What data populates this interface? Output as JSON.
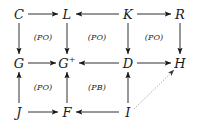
{
  "figure": {
    "kind": "commutative-diagram",
    "background_color": "#ffffff",
    "ink_color": "#1a1a1a",
    "width": 210,
    "height": 126
  },
  "nodes": [
    {
      "id": "C",
      "label": "C",
      "sup": "",
      "x": 19,
      "y": 14,
      "row": 0,
      "col": 0
    },
    {
      "id": "L",
      "label": "L",
      "sup": "",
      "x": 67,
      "y": 14,
      "row": 0,
      "col": 1
    },
    {
      "id": "K",
      "label": "K",
      "sup": "",
      "x": 128,
      "y": 14,
      "row": 0,
      "col": 2
    },
    {
      "id": "R",
      "label": "R",
      "sup": "",
      "x": 180,
      "y": 14,
      "row": 0,
      "col": 3
    },
    {
      "id": "G",
      "label": "G",
      "sup": "",
      "x": 19,
      "y": 63,
      "row": 1,
      "col": 0
    },
    {
      "id": "Gp",
      "label": "G",
      "sup": "+",
      "x": 67,
      "y": 63,
      "row": 1,
      "col": 1
    },
    {
      "id": "D",
      "label": "D",
      "sup": "",
      "x": 128,
      "y": 63,
      "row": 1,
      "col": 2
    },
    {
      "id": "H",
      "label": "H",
      "sup": "",
      "x": 180,
      "y": 63,
      "row": 1,
      "col": 3
    },
    {
      "id": "J",
      "label": "J",
      "sup": "",
      "x": 19,
      "y": 112,
      "row": 2,
      "col": 0
    },
    {
      "id": "F",
      "label": "F",
      "sup": "",
      "x": 67,
      "y": 112,
      "row": 2,
      "col": 1
    },
    {
      "id": "I",
      "label": "I",
      "sup": "",
      "x": 128,
      "y": 112,
      "row": 2,
      "col": 2
    }
  ],
  "arrows": [
    {
      "id": "C-to-L",
      "from": "C",
      "to": "L",
      "style": "solid",
      "x1": 28,
      "y1": 14,
      "x2": 58,
      "y2": 14
    },
    {
      "id": "K-to-L",
      "from": "K",
      "to": "L",
      "style": "solid",
      "x1": 119,
      "y1": 14,
      "x2": 76,
      "y2": 14
    },
    {
      "id": "K-to-R",
      "from": "K",
      "to": "R",
      "style": "solid",
      "x1": 137,
      "y1": 14,
      "x2": 171,
      "y2": 14
    },
    {
      "id": "G-to-Gp",
      "from": "G",
      "to": "Gp",
      "style": "solid",
      "x1": 28,
      "y1": 63,
      "x2": 56,
      "y2": 63
    },
    {
      "id": "D-to-Gp",
      "from": "D",
      "to": "Gp",
      "style": "solid",
      "x1": 119,
      "y1": 63,
      "x2": 79,
      "y2": 63
    },
    {
      "id": "D-to-H",
      "from": "D",
      "to": "H",
      "style": "solid",
      "x1": 137,
      "y1": 63,
      "x2": 171,
      "y2": 63
    },
    {
      "id": "J-to-F",
      "from": "J",
      "to": "F",
      "style": "solid",
      "x1": 28,
      "y1": 112,
      "x2": 58,
      "y2": 112
    },
    {
      "id": "I-to-F",
      "from": "I",
      "to": "F",
      "style": "solid",
      "x1": 119,
      "y1": 112,
      "x2": 76,
      "y2": 112
    },
    {
      "id": "C-to-G",
      "from": "C",
      "to": "G",
      "style": "solid",
      "x1": 19,
      "y1": 23,
      "x2": 19,
      "y2": 54
    },
    {
      "id": "L-to-Gp",
      "from": "L",
      "to": "Gp",
      "style": "solid",
      "x1": 67,
      "y1": 23,
      "x2": 67,
      "y2": 54
    },
    {
      "id": "K-to-D",
      "from": "K",
      "to": "D",
      "style": "solid",
      "x1": 128,
      "y1": 23,
      "x2": 128,
      "y2": 54
    },
    {
      "id": "R-to-H",
      "from": "R",
      "to": "H",
      "style": "solid",
      "x1": 180,
      "y1": 23,
      "x2": 180,
      "y2": 54
    },
    {
      "id": "J-to-G",
      "from": "J",
      "to": "G",
      "style": "solid",
      "x1": 19,
      "y1": 103,
      "x2": 19,
      "y2": 72
    },
    {
      "id": "F-to-Gp",
      "from": "F",
      "to": "Gp",
      "style": "solid",
      "x1": 67,
      "y1": 103,
      "x2": 67,
      "y2": 72
    },
    {
      "id": "I-to-D",
      "from": "I",
      "to": "D",
      "style": "solid",
      "x1": 128,
      "y1": 103,
      "x2": 128,
      "y2": 72
    },
    {
      "id": "I-to-H",
      "from": "I",
      "to": "H",
      "style": "dotted",
      "x1": 134,
      "y1": 109,
      "x2": 174,
      "y2": 70
    }
  ],
  "square_labels": [
    {
      "id": "po-top-left",
      "text": "(PO)",
      "x": 43,
      "y": 38
    },
    {
      "id": "po-top-middle",
      "text": "(PO)",
      "x": 97,
      "y": 38
    },
    {
      "id": "po-top-right",
      "text": "(PO)",
      "x": 154,
      "y": 38
    },
    {
      "id": "po-bottom-left",
      "text": "(PO)",
      "x": 43,
      "y": 88
    },
    {
      "id": "pb-bottom-middle",
      "text": "(PB)",
      "x": 97,
      "y": 88
    }
  ]
}
